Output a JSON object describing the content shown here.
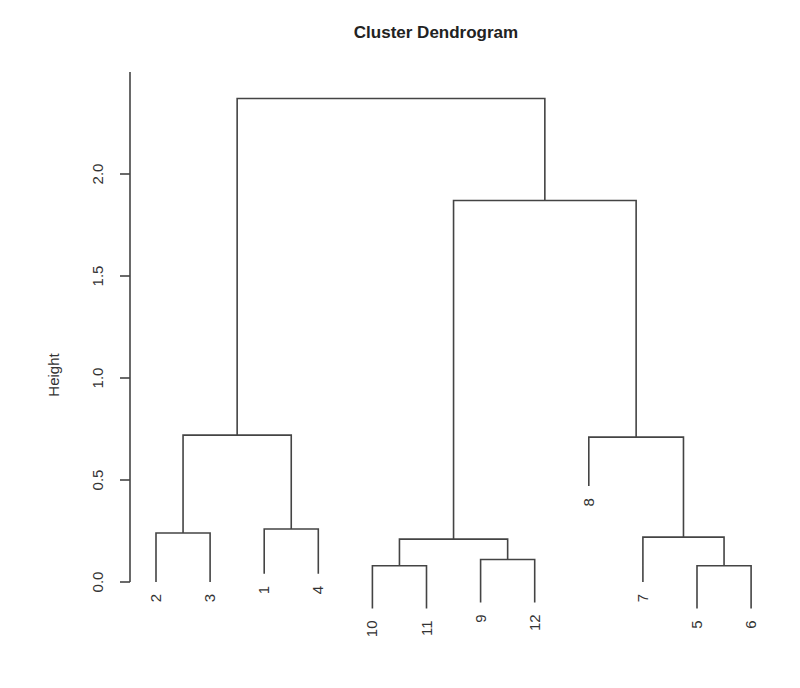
{
  "chart_data": {
    "type": "dendrogram",
    "title": "Cluster Dendrogram",
    "xlabel": "",
    "ylabel": "Height",
    "ylim": [
      0,
      2.4
    ],
    "yticks": [
      0.0,
      0.5,
      1.0,
      1.5,
      2.0
    ],
    "ytick_labels": [
      "0.0",
      "0.5",
      "1.0",
      "1.5",
      "2.0"
    ],
    "leaf_order": [
      "2",
      "3",
      "1",
      "4",
      "10",
      "11",
      "9",
      "12",
      "8",
      "7",
      "5",
      "6"
    ],
    "merges": [
      {
        "id": "m23",
        "children": [
          "2",
          "3"
        ],
        "height": 0.24
      },
      {
        "id": "m14",
        "children": [
          "1",
          "4"
        ],
        "height": 0.26
      },
      {
        "id": "m1011",
        "children": [
          "10",
          "11"
        ],
        "height": 0.08
      },
      {
        "id": "m912",
        "children": [
          "9",
          "12"
        ],
        "height": 0.11
      },
      {
        "id": "m56",
        "children": [
          "5",
          "6"
        ],
        "height": 0.08
      },
      {
        "id": "m756",
        "children": [
          "7",
          "m56"
        ],
        "height": 0.22
      },
      {
        "id": "m10_12",
        "children": [
          "m1011",
          "m912"
        ],
        "height": 0.21
      },
      {
        "id": "m8_6",
        "children": [
          "8",
          "m756"
        ],
        "height": 0.71
      },
      {
        "id": "m2_4",
        "children": [
          "m23",
          "m14"
        ],
        "height": 0.72
      },
      {
        "id": "mright",
        "children": [
          "m10_12",
          "m8_6"
        ],
        "height": 1.87
      },
      {
        "id": "mroot",
        "children": [
          "m2_4",
          "mright"
        ],
        "height": 2.37
      }
    ],
    "leaf_heights": {
      "2": 0.0,
      "3": 0.0,
      "1": 0.04,
      "4": 0.04,
      "10": -0.13,
      "11": -0.13,
      "9": -0.1,
      "12": -0.1,
      "8": 0.47,
      "7": 0.0,
      "5": -0.13,
      "6": -0.13
    }
  }
}
